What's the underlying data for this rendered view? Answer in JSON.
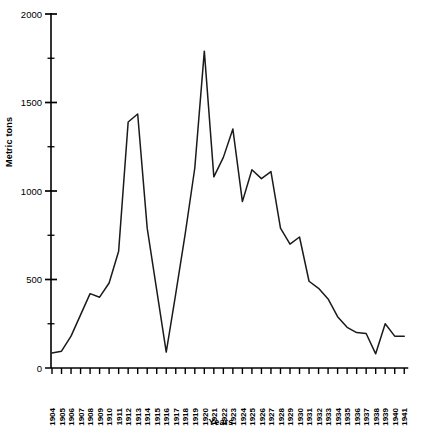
{
  "chart_data": {
    "type": "line",
    "title": "",
    "xlabel": "Years",
    "ylabel": "Metric tons",
    "ylim": [
      0,
      2000
    ],
    "y_ticks_major": [
      0,
      500,
      1000,
      1500,
      2000
    ],
    "y_tick_labels": [
      "0",
      "500",
      "1000",
      "1500",
      "2000"
    ],
    "y_minor_interval": 250,
    "grid": false,
    "legend": null,
    "categories": [
      "1904",
      "1905",
      "1906",
      "1907",
      "1908",
      "1909",
      "1910",
      "1911",
      "1912",
      "1913",
      "1914",
      "1915",
      "1916",
      "1917",
      "1918",
      "1919",
      "1920",
      "1921",
      "1922",
      "1923",
      "1924",
      "1925",
      "1926",
      "1927",
      "1928",
      "1929",
      "1930",
      "1931",
      "1932",
      "1933",
      "1934",
      "1935",
      "1936",
      "1937",
      "1938",
      "1939",
      "1940",
      "1941"
    ],
    "series": [
      {
        "name": "Metric tons",
        "values": [
          85,
          95,
          180,
          300,
          420,
          400,
          480,
          660,
          1390,
          1435,
          790,
          440,
          90,
          420,
          760,
          1130,
          1790,
          1080,
          1190,
          1350,
          940,
          1120,
          1070,
          1110,
          790,
          700,
          740,
          490,
          450,
          390,
          290,
          230,
          200,
          195,
          80,
          250,
          180,
          180
        ]
      }
    ]
  },
  "axes": {
    "y_title": "Metric tons",
    "x_title": "Years"
  }
}
